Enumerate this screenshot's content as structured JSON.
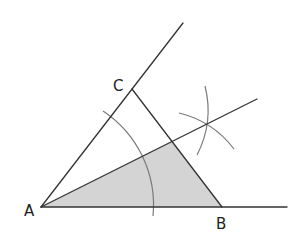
{
  "diagram": {
    "labels": {
      "a": "A",
      "b": "B",
      "c": "C"
    },
    "colors": {
      "line": "#333333",
      "arc": "#7a7a7a",
      "shaded_region": "#d4d4d4",
      "background": "#ffffff"
    },
    "points": {
      "A": [
        41,
        207
      ],
      "B": [
        222,
        207
      ],
      "C": [
        132,
        89
      ],
      "bisector_foot_on_BC": [
        172,
        141
      ],
      "arc_intersection": [
        207,
        123
      ]
    },
    "elements": [
      "ray AB (extended beyond B)",
      "ray AC (extended beyond C)",
      "segment BC",
      "angle bisector ray from A",
      "arc centered at A crossing AB and AC",
      "two construction arcs intersecting on the bisector",
      "shaded triangle formed by A, B and foot of bisector on BC"
    ]
  }
}
